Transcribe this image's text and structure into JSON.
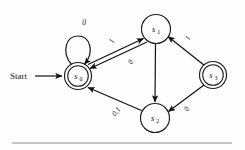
{
  "figure": {
    "kind": "finite-state-machine-diagram",
    "start_label": "Start",
    "accent_color": "#111111",
    "background_color": "#fdfdfd",
    "rule_color": "#8d8d8d"
  },
  "states": [
    {
      "id": "s0",
      "base": "s",
      "subscript": "0",
      "accepting": true,
      "x": 78,
      "y": 76,
      "radius": 13.5,
      "inner_radius": 10.3
    },
    {
      "id": "s1",
      "base": "s",
      "subscript": "1",
      "accepting": false,
      "x": 156,
      "y": 29,
      "radius": 14.5,
      "inner_radius": 0
    },
    {
      "id": "s2",
      "base": "s",
      "subscript": "2",
      "accepting": false,
      "x": 155,
      "y": 118,
      "radius": 14.5,
      "inner_radius": 0
    },
    {
      "id": "s3",
      "base": "s",
      "subscript": "3",
      "accepting": true,
      "x": 213,
      "y": 75,
      "radius": 13.5,
      "inner_radius": 10.3
    }
  ],
  "transitions": [
    {
      "id": "t-s0-self",
      "from": "s0",
      "to": "s0",
      "label": "0",
      "label_x": 86,
      "label_y": 22,
      "rotate": 0
    },
    {
      "id": "t-s0-s1",
      "from": "s0",
      "to": "s1",
      "label": "1",
      "label_x": 114,
      "label_y": 41,
      "rotate": -62
    },
    {
      "id": "t-s1-s0",
      "from": "s1",
      "to": "s0",
      "label": "0",
      "label_x": 132,
      "label_y": 62,
      "rotate": -62
    },
    {
      "id": "t-s1-s2",
      "from": "s1",
      "to": "s2",
      "label": "",
      "label_x": 0,
      "label_y": 0,
      "rotate": 0
    },
    {
      "id": "t-s2-s0",
      "from": "s2",
      "to": "s0",
      "label": "0,1",
      "label_x": 118,
      "label_y": 112,
      "rotate": -50
    },
    {
      "id": "t-s3-s1",
      "from": "s3",
      "to": "s1",
      "label": "1",
      "label_x": 189,
      "label_y": 38,
      "rotate": -63
    },
    {
      "id": "t-s3-s2",
      "from": "s3",
      "to": "s2",
      "label": "0",
      "label_x": 188,
      "label_y": 110,
      "rotate": -62
    }
  ],
  "start_arrow": {
    "label": "Start",
    "label_x": 10,
    "label_y": 79,
    "line_from_x": 35,
    "line_to_x": 63,
    "line_y": 76
  },
  "rule": {
    "x1": 12,
    "x2": 232,
    "y": 143
  }
}
